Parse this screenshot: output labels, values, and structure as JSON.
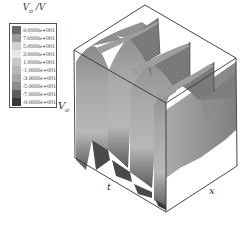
{
  "chart_data": {
    "type": "surface3d",
    "title": "",
    "legend": {
      "title": "V0 /V",
      "title_main": "V",
      "title_sub": "o",
      "title_unit": " /V",
      "position": "top-left",
      "entries": [
        {
          "label": "9.0000e+001",
          "value": 90,
          "color": "#6a6a6a"
        },
        {
          "label": "7.0000e+001",
          "value": 70,
          "color": "#9a9a9a"
        },
        {
          "label": "5.0000e+001",
          "value": 50,
          "color": "#d0d0d0"
        },
        {
          "label": "3.0000e+001",
          "value": 30,
          "color": "#e8e8e8"
        },
        {
          "label": "1.0000e+001",
          "value": 10,
          "color": "#c8c8c8"
        },
        {
          "label": "-1.0000e+001",
          "value": -10,
          "color": "#b8b8b8"
        },
        {
          "label": "-3.0000e+001",
          "value": -30,
          "color": "#a6a6a6"
        },
        {
          "label": "-5.0000e+001",
          "value": -50,
          "color": "#8c8c8c"
        },
        {
          "label": "-7.0000e+001",
          "value": -70,
          "color": "#5e5e5e"
        },
        {
          "label": "-9.0000e+001",
          "value": -90,
          "color": "#3a3a3a"
        }
      ]
    },
    "axes": {
      "z_label": "Vo",
      "z_label_main": "V",
      "z_label_sub": "o",
      "t_label": "t",
      "x_label": "x"
    },
    "colorbar_range": [
      -90,
      90
    ],
    "wave_crests_visible": 4,
    "grid": false
  }
}
